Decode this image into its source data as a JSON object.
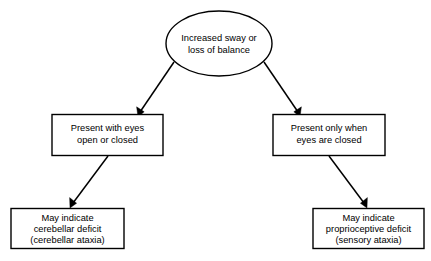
{
  "diagram": {
    "type": "flowchart",
    "background_color": "#ffffff",
    "stroke_color": "#000000",
    "text_color": "#000000",
    "nodes": {
      "root": {
        "shape": "ellipse",
        "line1": "Increased sway or",
        "line2": "loss of balance"
      },
      "branch_left": {
        "shape": "rectangle",
        "line1": "Present with eyes",
        "line2": "open or closed"
      },
      "branch_right": {
        "shape": "rectangle",
        "line1": "Present only when",
        "line2": "eyes are closed"
      },
      "outcome_left": {
        "shape": "rectangle",
        "line1": "May indicate",
        "line2": "cerebellar deficit",
        "line3": "(cerebellar ataxia)"
      },
      "outcome_right": {
        "shape": "rectangle",
        "line1": "May indicate",
        "line2": "proprioceptive deficit",
        "line3": "(sensory ataxia)"
      }
    },
    "edges": [
      {
        "name": "root-to-branch-left",
        "from": "root",
        "to": "branch_left",
        "label": ""
      },
      {
        "name": "root-to-branch-right",
        "from": "root",
        "to": "branch_right",
        "label": ""
      },
      {
        "name": "branch-left-to-outcome-left",
        "from": "branch_left",
        "to": "outcome_left",
        "label": ""
      },
      {
        "name": "branch-right-to-outcome-right",
        "from": "branch_right",
        "to": "outcome_right",
        "label": ""
      }
    ]
  }
}
